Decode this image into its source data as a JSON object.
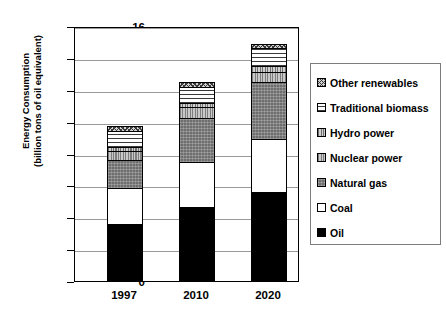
{
  "chart_data": {
    "type": "bar",
    "stacked": true,
    "title": "",
    "xlabel": "",
    "ylabel": "Energy Consumption (billion tons of oil equivalent)",
    "ylabel_line1": "Energy Consumption",
    "ylabel_line2": "(billion tons of oil equivalent)",
    "categories": [
      "1997",
      "2010",
      "2020"
    ],
    "ylim": [
      0,
      16
    ],
    "yticks": [
      0,
      2,
      4,
      6,
      8,
      10,
      12,
      14,
      16
    ],
    "ytick_labels": [
      "0",
      "2",
      "4",
      "6",
      "8",
      "10",
      "12",
      "14",
      "16"
    ],
    "grid": true,
    "legend_position": "right",
    "series": [
      {
        "name": "Oil",
        "pattern": "solid-black",
        "values": [
          3.6,
          4.65,
          5.6
        ]
      },
      {
        "name": "Coal",
        "pattern": "solid-white",
        "values": [
          2.25,
          2.8,
          3.3
        ]
      },
      {
        "name": "Natural gas",
        "pattern": "dark-gray-stipple",
        "values": [
          1.75,
          2.75,
          3.6
        ]
      },
      {
        "name": "Nuclear power",
        "pattern": "vertical-lines",
        "values": [
          0.55,
          0.7,
          0.6
        ]
      },
      {
        "name": "Hydro power",
        "pattern": "vertical-lines-gray",
        "values": [
          0.25,
          0.3,
          0.4
        ]
      },
      {
        "name": "Traditional biomass",
        "pattern": "horizontal-lines",
        "values": [
          1.0,
          1.0,
          1.1
        ]
      },
      {
        "name": "Other renewables",
        "pattern": "cross-hatch",
        "values": [
          0.3,
          0.3,
          0.3
        ]
      }
    ],
    "totals": [
      9.7,
      12.5,
      14.9
    ]
  },
  "legend": {
    "entries": [
      {
        "label": "Other renewables"
      },
      {
        "label": "Traditional biomass"
      },
      {
        "label": "Hydro power"
      },
      {
        "label": "Nuclear power"
      },
      {
        "label": "Natural gas"
      },
      {
        "label": "Coal"
      },
      {
        "label": "Oil"
      }
    ]
  }
}
